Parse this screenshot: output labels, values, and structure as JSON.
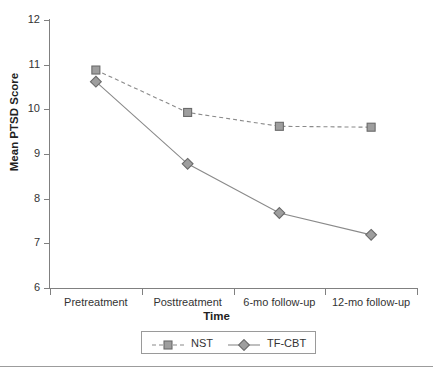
{
  "chart_data": {
    "type": "line",
    "title": "",
    "xlabel": "Time",
    "ylabel": "Mean PTSD Score",
    "categories": [
      "Pretreatment",
      "Posttreatment",
      "6-mo follow-up",
      "12-mo follow-up"
    ],
    "series": [
      {
        "name": "NST",
        "values": [
          10.88,
          9.93,
          9.62,
          9.6
        ],
        "marker": "square",
        "linestyle": "dashed",
        "color": "#8c8c8c"
      },
      {
        "name": "TF-CBT",
        "values": [
          10.62,
          8.78,
          7.68,
          7.19
        ],
        "marker": "diamond",
        "linestyle": "solid",
        "color": "#8c8c8c"
      }
    ],
    "ylim": [
      6,
      12
    ],
    "yticks": [
      6,
      7,
      8,
      9,
      10,
      11,
      12
    ],
    "ytick_labels": [
      "6",
      "7",
      "8",
      "9",
      "10",
      "11",
      "12"
    ],
    "grid": false,
    "legend_position": "bottom-center",
    "legend_entries": [
      "NST",
      "TF-CBT"
    ]
  },
  "colors": {
    "axis": "#808080",
    "marker_fill": "#9e9e9e",
    "marker_stroke": "#6a6a6a",
    "line": "#8a8a8a",
    "text": "#333333",
    "legend_border": "#9a9a9a",
    "bottom_rule": "#9c9c9c"
  }
}
